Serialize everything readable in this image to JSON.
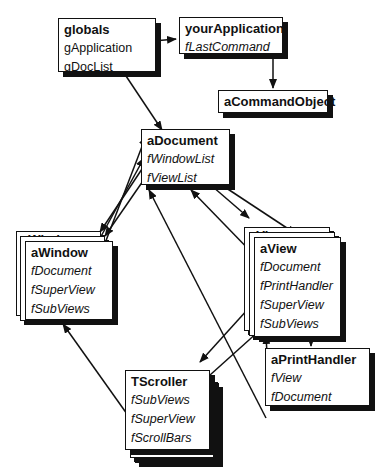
{
  "diagram": {
    "type": "object-reference-diagram",
    "nodes": {
      "globals": {
        "title": "globals",
        "fields": [
          "gApplication",
          "gDocList"
        ],
        "field_style": "roman"
      },
      "yourApplication": {
        "title": "yourApplication",
        "fields": [
          "fLastCommand"
        ],
        "field_style": "italic"
      },
      "aCommandObject": {
        "title": "aCommandObject",
        "fields": []
      },
      "aDocument": {
        "title": "aDocument",
        "fields": [
          "fWindowList",
          "fViewList"
        ],
        "field_style": "italic"
      },
      "aWindow": {
        "title": "aWindow",
        "ghost_title": "aWindow",
        "fields": [
          "fDocument",
          "fSuperView",
          "fSubViews"
        ],
        "field_style": "italic",
        "stacked": true
      },
      "aView": {
        "title": "aView",
        "ghost_title": "aView",
        "fields": [
          "fDocument",
          "fPrintHandler",
          "fSuperView",
          "fSubViews"
        ],
        "field_style": "italic",
        "stacked": true
      },
      "aPrintHandler": {
        "title": "aPrintHandler",
        "fields": [
          "fView",
          "fDocument"
        ],
        "field_style": "italic"
      },
      "TScroller": {
        "title": "TScroller",
        "fields": [
          "fSubViews",
          "fSuperView",
          "fScrollBars"
        ],
        "field_style": "italic",
        "stacked": true
      }
    },
    "edges": [
      {
        "from": "globals.gApplication",
        "to": "yourApplication"
      },
      {
        "from": "globals.gDocList",
        "to": "aDocument"
      },
      {
        "from": "yourApplication.fLastCommand",
        "to": "aCommandObject"
      },
      {
        "from": "aDocument.fWindowList",
        "to": "aWindow"
      },
      {
        "from": "aDocument.fViewList",
        "to": "aView"
      },
      {
        "from": "aWindow.fDocument",
        "to": "aDocument"
      },
      {
        "from": "aView.fDocument",
        "to": "aDocument"
      },
      {
        "from": "aView.fPrintHandler",
        "to": "aPrintHandler"
      },
      {
        "from": "aView.fSuperView",
        "to": "TScroller"
      },
      {
        "from": "aPrintHandler.fView",
        "to": "aView"
      },
      {
        "from": "aPrintHandler.fDocument",
        "to": "aDocument"
      },
      {
        "from": "TScroller.fSubViews",
        "to": "aView"
      },
      {
        "from": "TScroller.fSuperView",
        "to": "aWindow"
      }
    ]
  }
}
